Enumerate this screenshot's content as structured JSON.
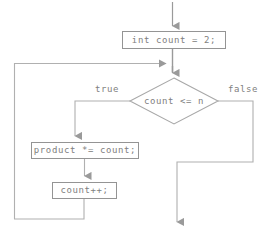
{
  "diagram": {
    "type": "flowchart",
    "nodes": {
      "init": {
        "text": "int count = 2;",
        "shape": "rectangle"
      },
      "condition": {
        "text": "count <= n",
        "shape": "diamond"
      },
      "product": {
        "text": "product *= count;",
        "shape": "rectangle"
      },
      "increment": {
        "text": "count++;",
        "shape": "rectangle"
      }
    },
    "edge_labels": {
      "true": "true",
      "false": "false"
    },
    "colors": {
      "stroke": "#949494",
      "text": "#808080",
      "arrow": "#9a9a9a",
      "background": "#ffffff"
    }
  }
}
